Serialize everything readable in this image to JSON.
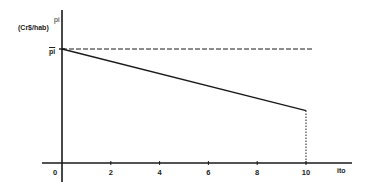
{
  "chart_data": {
    "type": "line",
    "title": "",
    "xlabel": "ito",
    "ylabel": "pi",
    "ylabel_unit": "(Cr$/hab)",
    "y_reference_label": "p̄i",
    "x_ticks": [
      0,
      2,
      4,
      6,
      8,
      10
    ],
    "xlim": [
      0,
      11
    ],
    "ylim": [
      0,
      1.1
    ],
    "y_ticks_numeric": false,
    "grid": false,
    "legend": null,
    "series": [
      {
        "name": "pi",
        "style": "solid",
        "x": [
          0,
          10
        ],
        "y": [
          1.0,
          0.46
        ]
      },
      {
        "name": "p̄i reference",
        "style": "dashed",
        "x": [
          0,
          10.3
        ],
        "y": [
          1.0,
          1.0
        ]
      },
      {
        "name": "drop at ito=10",
        "style": "dotted",
        "x": [
          10,
          10
        ],
        "y": [
          0.46,
          0
        ]
      }
    ]
  },
  "labels": {
    "y_axis_symbol": "pi",
    "y_axis_unit": "(Cr$/hab)",
    "y_ref": "pi",
    "x_axis": "ito"
  }
}
